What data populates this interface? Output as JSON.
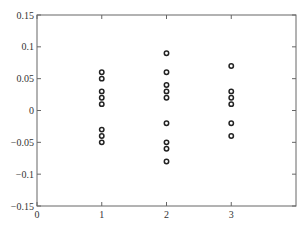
{
  "chart_data": {
    "type": "scatter",
    "title": "",
    "xlabel": "",
    "ylabel": "",
    "xlim": [
      0,
      4
    ],
    "ylim": [
      -0.15,
      0.15
    ],
    "grid": false,
    "legend": null,
    "x_ticks": [
      0,
      1,
      2,
      3
    ],
    "x_tick_labels": [
      "0",
      "1",
      "2",
      "3"
    ],
    "y_ticks": [
      0.15,
      0.1,
      0.05,
      0,
      -0.05,
      -0.1,
      -0.15
    ],
    "y_tick_labels": [
      "0.15",
      "0.1",
      "0.05",
      "0",
      "−0.05",
      "−0.1",
      "−0.15"
    ],
    "marker": "circle-open",
    "marker_color": "#222222",
    "series": [
      {
        "name": "group 1",
        "x": [
          1,
          1,
          1,
          1,
          1,
          1,
          1,
          1
        ],
        "y": [
          0.06,
          0.05,
          0.03,
          0.02,
          0.01,
          -0.03,
          -0.04,
          -0.05
        ]
      },
      {
        "name": "group 2",
        "x": [
          2,
          2,
          2,
          2,
          2,
          2,
          2,
          2,
          2
        ],
        "y": [
          0.09,
          0.06,
          0.04,
          0.03,
          0.02,
          -0.02,
          -0.05,
          -0.06,
          -0.08
        ]
      },
      {
        "name": "group 3",
        "x": [
          3,
          3,
          3,
          3,
          3,
          3
        ],
        "y": [
          0.07,
          0.03,
          0.02,
          0.01,
          -0.02,
          -0.04
        ]
      }
    ]
  },
  "layout": {
    "plot_left": 37,
    "plot_right": 296,
    "plot_top": 15,
    "plot_bottom": 206
  }
}
